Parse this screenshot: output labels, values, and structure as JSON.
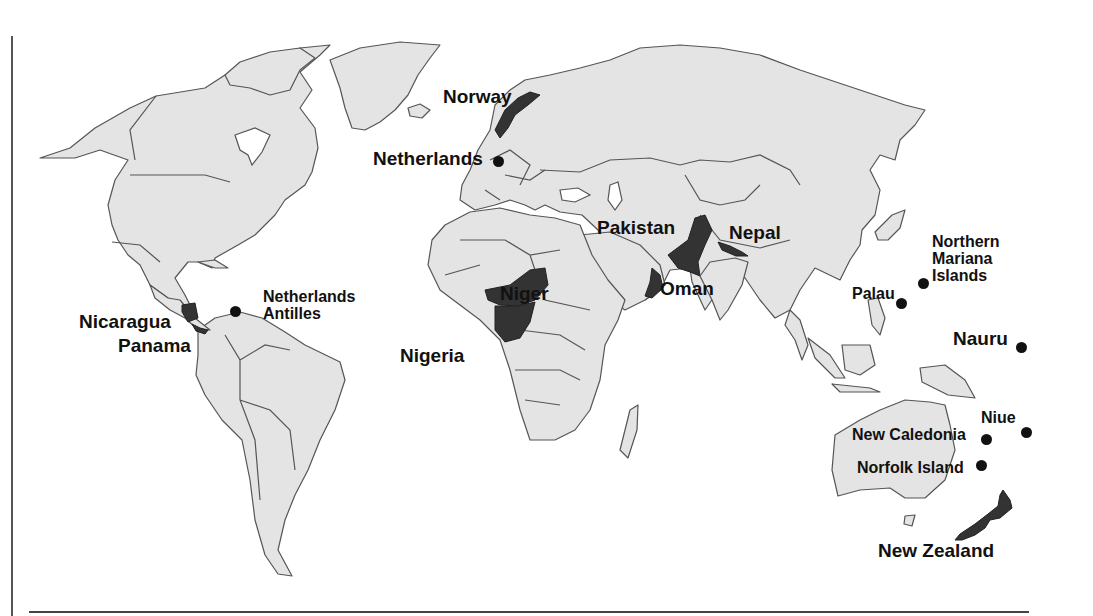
{
  "map": {
    "type": "world political outline map",
    "land_color": "#e4e4e4",
    "highlight_color": "#333333",
    "border_color": "#555555",
    "highlighted_countries": [
      "Norway",
      "Nicaragua",
      "Panama",
      "Niger",
      "Nigeria",
      "Oman",
      "Pakistan",
      "Nepal",
      "New Zealand"
    ],
    "labels": [
      {
        "id": "norway",
        "text": "Norway",
        "marker": "shaded"
      },
      {
        "id": "netherlands",
        "text": "Netherlands",
        "marker": "dot"
      },
      {
        "id": "netherlands_antilles",
        "text": "Netherlands Antilles",
        "line1": "Netherlands",
        "line2": "Antilles",
        "marker": "dot"
      },
      {
        "id": "nicaragua",
        "text": "Nicaragua",
        "marker": "shaded"
      },
      {
        "id": "panama",
        "text": "Panama",
        "marker": "shaded"
      },
      {
        "id": "niger",
        "text": "Niger",
        "marker": "shaded"
      },
      {
        "id": "nigeria",
        "text": "Nigeria",
        "marker": "shaded"
      },
      {
        "id": "pakistan",
        "text": "Pakistan",
        "marker": "shaded"
      },
      {
        "id": "nepal",
        "text": "Nepal",
        "marker": "shaded"
      },
      {
        "id": "oman",
        "text": "Oman",
        "marker": "shaded"
      },
      {
        "id": "northern_mariana",
        "text": "Northern Mariana Islands",
        "line1": "Northern",
        "line2": "Mariana",
        "line3": "Islands",
        "marker": "dot"
      },
      {
        "id": "palau",
        "text": "Palau",
        "marker": "dot"
      },
      {
        "id": "nauru",
        "text": "Nauru",
        "marker": "dot"
      },
      {
        "id": "niue",
        "text": "Niue",
        "marker": "dot"
      },
      {
        "id": "new_caledonia",
        "text": "New Caledonia",
        "marker": "dot"
      },
      {
        "id": "norfolk_island",
        "text": "Norfolk Island",
        "marker": "dot"
      },
      {
        "id": "new_zealand",
        "text": "New Zealand",
        "marker": "shaded"
      }
    ]
  }
}
